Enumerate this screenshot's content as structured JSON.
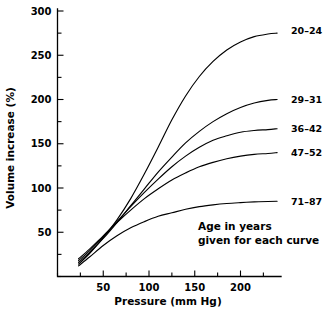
{
  "chart_data": {
    "type": "line",
    "title": "",
    "xlabel": "Pressure (mm Hg)",
    "ylabel": "Volume increase (%)",
    "xlim": [
      0,
      245
    ],
    "ylim": [
      0,
      300
    ],
    "xticks": [
      50,
      100,
      150,
      200
    ],
    "xticklabels": [
      "50",
      "100",
      "150",
      "200"
    ],
    "xminor_step": 25,
    "yticks": [
      50,
      100,
      150,
      200,
      250,
      300
    ],
    "yticklabels": [
      "50",
      "100",
      "150",
      "200",
      "250",
      "300"
    ],
    "yminor_step": 25,
    "grid": false,
    "legend_position": "right-of-curve-ends",
    "annotation": {
      "line1": "Age in years",
      "line2": "given for each curve"
    },
    "series": [
      {
        "name": "20-24",
        "label": "20–24",
        "label_y_value": 278,
        "x": [
          23,
          35,
          50,
          65,
          80,
          95,
          110,
          125,
          140,
          155,
          170,
          185,
          200,
          215,
          230,
          240
        ],
        "y": [
          14,
          26,
          44,
          64,
          88,
          116,
          146,
          177,
          204,
          226,
          243,
          256,
          265,
          271,
          274,
          275
        ]
      },
      {
        "name": "29-31",
        "label": "29–31",
        "label_y_value": 200,
        "x": [
          23,
          35,
          50,
          65,
          80,
          95,
          110,
          125,
          140,
          155,
          170,
          185,
          200,
          215,
          230,
          240
        ],
        "y": [
          16,
          27,
          43,
          61,
          80,
          99,
          118,
          135,
          151,
          164,
          175,
          184,
          191,
          196,
          199,
          200
        ]
      },
      {
        "name": "36-42",
        "label": "36–42",
        "label_y_value": 167,
        "x": [
          23,
          35,
          50,
          65,
          80,
          95,
          110,
          125,
          140,
          155,
          170,
          185,
          200,
          215,
          230,
          240
        ],
        "y": [
          18,
          29,
          45,
          62,
          79,
          95,
          110,
          124,
          136,
          146,
          154,
          159,
          163,
          165,
          166,
          167
        ]
      },
      {
        "name": "47-52",
        "label": "47–52",
        "label_y_value": 140,
        "x": [
          23,
          35,
          50,
          65,
          80,
          95,
          110,
          125,
          140,
          155,
          170,
          185,
          200,
          215,
          230,
          240
        ],
        "y": [
          20,
          31,
          46,
          61,
          75,
          88,
          99,
          109,
          117,
          124,
          129,
          133,
          136,
          138,
          139,
          140
        ]
      },
      {
        "name": "71-87",
        "label": "71–87",
        "label_y_value": 85,
        "x": [
          23,
          35,
          50,
          65,
          80,
          95,
          110,
          125,
          140,
          155,
          170,
          185,
          200,
          215,
          230,
          240
        ],
        "y": [
          12,
          22,
          35,
          46,
          55,
          62,
          68,
          72,
          76,
          79,
          81,
          82.5,
          83.5,
          84.3,
          84.8,
          85
        ]
      }
    ]
  }
}
